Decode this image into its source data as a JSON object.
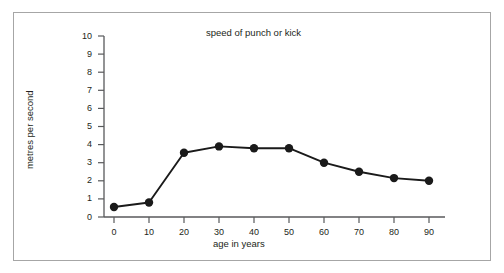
{
  "chart_data": {
    "type": "line",
    "title": "speed of punch or kick",
    "xlabel": "age in years",
    "ylabel": "metres per second",
    "x": [
      0,
      10,
      20,
      30,
      40,
      50,
      60,
      70,
      80,
      90
    ],
    "values": [
      0.55,
      0.8,
      3.55,
      3.9,
      3.8,
      3.8,
      3.0,
      2.5,
      2.15,
      2.0
    ],
    "xlim": [
      0,
      90
    ],
    "ylim": [
      0,
      10
    ],
    "xticks": [
      "0",
      "10",
      "20",
      "30",
      "40",
      "50",
      "60",
      "70",
      "80",
      "90"
    ],
    "yticks": [
      "0",
      "1",
      "2",
      "3",
      "4",
      "5",
      "6",
      "7",
      "8",
      "9",
      "10"
    ],
    "grid": false,
    "legend": false,
    "marker": "filled-circle",
    "line_color": "#1a1a1a",
    "marker_color": "#1a1a1a",
    "axis_color": "#58595b",
    "frame_color": "#a6a6a6"
  }
}
